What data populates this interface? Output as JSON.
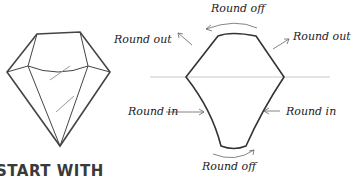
{
  "diagram": {
    "labels": {
      "top": "Round off",
      "bottom": "Round off",
      "upper_left": "Round out",
      "upper_right": "Round out",
      "lower_left": "Round in",
      "lower_right": "Round in"
    },
    "heading": "START WITH",
    "colors": {
      "stroke": "#333333",
      "guide": "#bbbbbb"
    }
  }
}
